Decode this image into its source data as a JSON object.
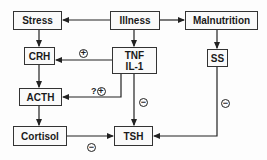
{
  "nodes": {
    "stress": "Stress",
    "illness": "Illness",
    "malnutrition": "Malnutrition",
    "crh": "CRH",
    "tnf_line1": "TNF",
    "tnf_line2": "IL-1",
    "ss": "SS",
    "acth": "ACTH",
    "cortisol": "Cortisol",
    "tsh": "TSH"
  },
  "edges": [
    {
      "from": "Illness",
      "to": "Stress",
      "sign": ""
    },
    {
      "from": "Illness",
      "to": "Malnutrition",
      "sign": ""
    },
    {
      "from": "Illness",
      "to": "TNF IL-1",
      "sign": ""
    },
    {
      "from": "Stress",
      "to": "CRH",
      "sign": ""
    },
    {
      "from": "TNF IL-1",
      "to": "CRH",
      "sign": "+"
    },
    {
      "from": "TNF IL-1",
      "to": "ACTH",
      "sign": "?+"
    },
    {
      "from": "TNF IL-1",
      "to": "TSH",
      "sign": "-"
    },
    {
      "from": "CRH",
      "to": "ACTH",
      "sign": ""
    },
    {
      "from": "ACTH",
      "to": "Cortisol",
      "sign": ""
    },
    {
      "from": "Cortisol",
      "to": "TSH",
      "sign": "-"
    },
    {
      "from": "Malnutrition",
      "to": "SS",
      "sign": ""
    },
    {
      "from": "SS",
      "to": "TSH",
      "sign": "-"
    }
  ],
  "signs": {
    "plus": "+",
    "minus": "−",
    "question": "?"
  }
}
